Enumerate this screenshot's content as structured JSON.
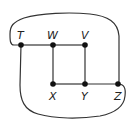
{
  "diagram": {
    "type": "graph",
    "nodes": [
      {
        "id": "T",
        "label": "T",
        "x": 21,
        "y": 45,
        "label_pos": "above"
      },
      {
        "id": "W",
        "label": "W",
        "x": 53,
        "y": 45,
        "label_pos": "above"
      },
      {
        "id": "V",
        "label": "V",
        "x": 85,
        "y": 45,
        "label_pos": "above"
      },
      {
        "id": "X",
        "label": "X",
        "x": 53,
        "y": 84,
        "label_pos": "below"
      },
      {
        "id": "Y",
        "label": "Y",
        "x": 85,
        "y": 84,
        "label_pos": "below"
      },
      {
        "id": "Z",
        "label": "Z",
        "x": 118,
        "y": 84,
        "label_pos": "below"
      }
    ],
    "edges": [
      {
        "from": "T",
        "to": "W",
        "shape": "straight"
      },
      {
        "from": "W",
        "to": "V",
        "shape": "straight"
      },
      {
        "from": "W",
        "to": "X",
        "shape": "straight"
      },
      {
        "from": "V",
        "to": "Y",
        "shape": "straight"
      },
      {
        "from": "X",
        "to": "Y",
        "shape": "straight"
      },
      {
        "from": "Y",
        "to": "Z",
        "shape": "straight"
      },
      {
        "from": "T",
        "to": "Z",
        "shape": "curve-over-top"
      },
      {
        "from": "T",
        "to": "Z",
        "shape": "curve-under-bottom"
      }
    ],
    "colors": {
      "line": "#333333",
      "node": "#111111",
      "background": "#ffffff"
    }
  }
}
